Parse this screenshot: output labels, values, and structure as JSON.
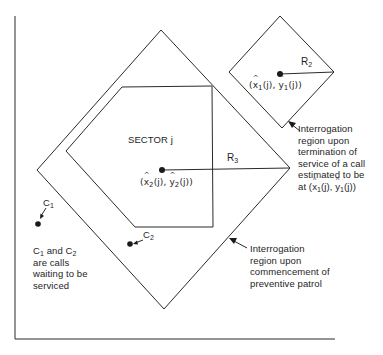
{
  "diagram": {
    "colors": {
      "stroke": "#2a2a2a",
      "text": "#1e1e1e",
      "background": "#ffffff"
    },
    "axes": {
      "vertical": {
        "x": 15,
        "y1": 16,
        "y2": 339
      },
      "horizontal": {
        "y": 339,
        "x1": 15,
        "x2": 335
      }
    },
    "shapes": {
      "large_diamond": {
        "points": "161,30 290,168 164,309 37,170",
        "name": "Interrogation region upon commencement of preventive patrol"
      },
      "small_diamond": {
        "points": "280,16 334,72 282,128 229,72",
        "name": "Interrogation region upon termination of service"
      },
      "sector_polygon": {
        "points": "122,87 212,86 213,227 135,227 66,151",
        "name": "Sector j"
      }
    },
    "points": {
      "center_1": {
        "x": 280,
        "y": 74
      },
      "center_2": {
        "x": 162,
        "y": 170
      },
      "c1": {
        "x": 38,
        "y": 224
      },
      "c2": {
        "x": 130,
        "y": 244
      }
    },
    "labels": {
      "sector": "SECTOR j",
      "r2": "R",
      "r2_sub": "2",
      "r3": "R",
      "r3_sub": "3",
      "c1": "C",
      "c1_sub": "1",
      "c2": "C",
      "c2_sub": "2",
      "point1": {
        "open": "(",
        "x": "x",
        "x_sub": "1",
        "mid": "(j), ",
        "y": "y",
        "y_sub": "1",
        "close": "(j))"
      },
      "point2": {
        "open": "(",
        "x": "x",
        "x_sub": "2",
        "mid": "(j), ",
        "y": "y",
        "y_sub": "2",
        "close": "(j))"
      },
      "calls_note": {
        "line1_a": "C",
        "line1_a_sub": "1",
        "line1_b": " and C",
        "line1_b_sub": "2",
        "line2": "are calls",
        "line3": "waiting to be",
        "line4": "serviced"
      },
      "termination_note": {
        "line1": "Interrogation",
        "line2": "region upon",
        "line3": "termination of",
        "line4": "service of a call",
        "line5": "estimated to be",
        "line6_prefix": "at (",
        "line6_x": "x",
        "line6_x_sub": "1",
        "line6_mid": "(j), ",
        "line6_y": "y",
        "line6_y_sub": "1",
        "line6_close": "(j))"
      },
      "commencement_note": {
        "line1": "Interrogation",
        "line2": "region upon",
        "line3": "commencement of",
        "line4": "preventive patrol"
      }
    }
  }
}
